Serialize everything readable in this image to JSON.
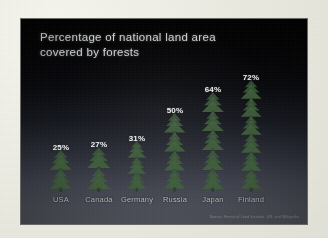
{
  "slide": {
    "title": "Percentage of national land area\ncovered by forests",
    "source_note": "Source: Forest of Land Institute, UN, and Wikipedia",
    "background_top_color": "#010101",
    "background_bottom_color": "#53555e",
    "title_color": "#cfd2d0",
    "tree_color": "#3e5e3a",
    "value_color": "#f0f2f0",
    "label_color": "#b9bcc0"
  },
  "frame": {
    "paper_color": "#eeeee6"
  },
  "chart_data": {
    "type": "bar",
    "title": "Percentage of national land area covered by forests",
    "xlabel": "",
    "ylabel": "Percentage of land area covered by forests",
    "ylim": [
      0,
      80
    ],
    "grid": false,
    "legend": "none",
    "categories": [
      "USA",
      "Canada",
      "Germany",
      "Russia",
      "Japan",
      "Finland"
    ],
    "values": [
      25,
      27,
      31,
      50,
      64,
      72
    ],
    "value_labels": [
      "25%",
      "27%",
      "31%",
      "50%",
      "64%",
      "72%"
    ],
    "pictogram": "pine-tree",
    "tree_counts": [
      2,
      2,
      3,
      4,
      5,
      6
    ],
    "note": "Bars are drawn as stacks of pine-tree pictograms whose height is proportional to the percentage."
  }
}
